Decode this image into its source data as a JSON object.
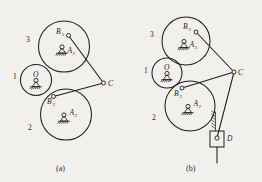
{
  "figure": {
    "background_color": "#f2f0ed",
    "line_color": "#1e1e1e",
    "panels": [
      {
        "id": "a",
        "caption": "(a)",
        "members": [
          {
            "name": "1",
            "type": "small-circle-link"
          },
          {
            "name": "2",
            "type": "large-circle-link"
          },
          {
            "name": "3",
            "type": "large-circle-link"
          }
        ],
        "points": [
          {
            "label": "B",
            "subscript": "3",
            "type": "pin-joint"
          },
          {
            "label": "A",
            "subscript": "3",
            "type": "fixed-pivot"
          },
          {
            "label": "O",
            "subscript": "",
            "type": "fixed-pivot"
          },
          {
            "label": "B",
            "subscript": "2",
            "type": "pin-joint"
          },
          {
            "label": "A",
            "subscript": "2",
            "type": "fixed-pivot"
          },
          {
            "label": "C",
            "subscript": "",
            "type": "pin-joint"
          }
        ]
      },
      {
        "id": "b",
        "caption": "(b)",
        "members": [
          {
            "name": "1",
            "type": "small-circle-link"
          },
          {
            "name": "2",
            "type": "large-circle-link"
          },
          {
            "name": "3",
            "type": "large-circle-link"
          }
        ],
        "points": [
          {
            "label": "B",
            "subscript": "3",
            "type": "pin-joint"
          },
          {
            "label": "A",
            "subscript": "3",
            "type": "fixed-pivot"
          },
          {
            "label": "O",
            "subscript": "",
            "type": "fixed-pivot"
          },
          {
            "label": "B",
            "subscript": "2",
            "type": "pin-joint"
          },
          {
            "label": "A",
            "subscript": "2",
            "type": "fixed-pivot"
          },
          {
            "label": "C",
            "subscript": "",
            "type": "pin-joint"
          },
          {
            "label": "D",
            "subscript": "",
            "type": "slider-block"
          }
        ]
      }
    ]
  },
  "panel_a": {
    "caption": "(a)",
    "num3": "3",
    "num1": "1",
    "num2": "2",
    "B3": "B",
    "B3sub": "3",
    "A3": "A",
    "A3sub": "3",
    "O": "O",
    "B2": "B",
    "B2sub": "2",
    "A2": "A",
    "A2sub": "2",
    "C": "C"
  },
  "panel_b": {
    "caption": "(b)",
    "num3": "3",
    "num1": "1",
    "num2": "2",
    "B3": "B",
    "B3sub": "3",
    "A3": "A",
    "A3sub": "3",
    "O": "O",
    "B2": "B",
    "B2sub": "2",
    "A2": "A",
    "A2sub": "2",
    "C": "C",
    "D": "D"
  }
}
